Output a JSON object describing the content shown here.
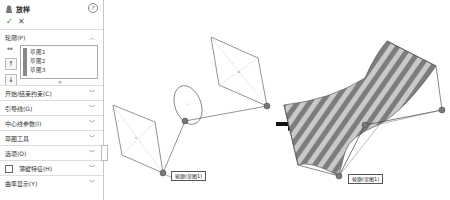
{
  "panel": {
    "title": "放样",
    "help_icon": "?",
    "ok_icon": "✓",
    "cancel_icon": "✕",
    "sections": [
      {
        "label": "轮廓(P)",
        "expanded": true
      },
      {
        "label": "开始/结束约束(C)",
        "expanded": false
      },
      {
        "label": "引导线(G)",
        "expanded": false
      },
      {
        "label": "中心线参数(I)",
        "expanded": false
      },
      {
        "label": "草图工具",
        "expanded": false
      },
      {
        "label": "选项(O)",
        "expanded": false
      },
      {
        "label": "薄壁特征(H)",
        "expanded": false,
        "checkbox": true,
        "checked": false
      },
      {
        "label": "曲率显示(Y)",
        "expanded": false
      }
    ],
    "profiles": [
      "草图1",
      "草图2",
      "草图3"
    ],
    "tools": [
      "select-other",
      "move-up",
      "move-down"
    ],
    "grip": "≡"
  },
  "canvas": {
    "labels": {
      "left_connector": "轮廓(草图1)",
      "right_connector": "轮廓(草图1)"
    },
    "arrow": "➜",
    "colors": {
      "sketch_line": "#777777",
      "construction_line": "#bbbbbb",
      "point": "#666666",
      "surface_light": "#c8c8c8",
      "surface_dark": "#7a7a7a"
    }
  }
}
